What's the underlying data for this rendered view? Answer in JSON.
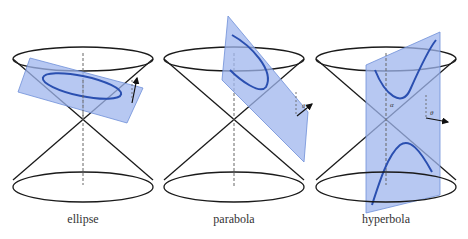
{
  "figure": {
    "panels": [
      {
        "id": "ellipse",
        "caption": "ellipse"
      },
      {
        "id": "parabola",
        "caption": "parabola",
        "angle_label": "θ"
      },
      {
        "id": "hyperbola",
        "caption": "hyperbola",
        "angle_labels": [
          "α",
          "θ"
        ]
      }
    ],
    "colors": {
      "plane_fill": "#9fb6ee",
      "plane_stroke": "#6f8fd8",
      "curve": "#2a4fb0",
      "cone": "#1a1a1a"
    }
  }
}
